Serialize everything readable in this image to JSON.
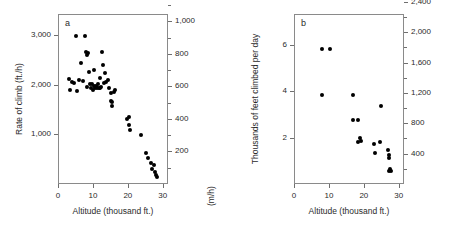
{
  "figure": {
    "panels": [
      {
        "letter": "a",
        "x_axis": {
          "title": "Altitude (thousand ft.)",
          "ticks": [
            "0",
            "10",
            "20",
            "30"
          ],
          "tick_values": [
            0,
            10,
            20,
            30
          ],
          "range": [
            0,
            31.5
          ]
        },
        "y_axis_left": {
          "title": "Rate of climb (ft./h)",
          "ticks": [
            "1,000",
            "2,000",
            "3,000"
          ],
          "tick_values": [
            1000,
            2000,
            3000
          ],
          "range": [
            0,
            3430
          ]
        },
        "y_axis_right": {
          "title": "(m/h)",
          "ticks": [
            "200",
            "400",
            "600",
            "800",
            "1,000",
            "1,200"
          ],
          "tick_values": [
            200,
            400,
            600,
            800,
            1000,
            1200
          ],
          "minor_tick_values": [
            100,
            300,
            500,
            700,
            900,
            1100
          ],
          "range": [
            0,
            1045
          ]
        }
      },
      {
        "letter": "b",
        "x_axis": {
          "title": "Altitude (thousand ft.)",
          "ticks": [
            "0",
            "10",
            "20",
            "30"
          ],
          "tick_values": [
            0,
            10,
            20,
            30
          ],
          "range": [
            0,
            31.5
          ]
        },
        "y_axis_left": {
          "title": "Thousands of feet climbed per day",
          "ticks": [
            "2",
            "4",
            "6"
          ],
          "tick_values": [
            2,
            4,
            6
          ],
          "range": [
            0,
            7.35
          ]
        },
        "y_axis_right": {
          "title": "",
          "ticks": [
            "400",
            "800",
            "1,200",
            "1,600",
            "2,000",
            "2,400"
          ],
          "tick_values": [
            400,
            800,
            1200,
            1600,
            2000,
            2400
          ],
          "minor_tick_values": [
            200,
            600,
            1000,
            1400,
            1800,
            2200
          ],
          "range": [
            0,
            2240
          ]
        }
      }
    ]
  },
  "chart_data": [
    {
      "type": "scatter",
      "panel": "a",
      "title": "",
      "xlabel": "Altitude (thousand ft.)",
      "ylabel": "Rate of climb (ft./h)",
      "ylabel_right": "(m/h)",
      "xlim": [
        0,
        31.5
      ],
      "ylim": [
        0,
        3430
      ],
      "ylim_right": [
        0,
        1045
      ],
      "grid": false,
      "legend": "none",
      "marker": "filled-circle",
      "points": [
        [
          3.2,
          2120
        ],
        [
          3.3,
          1900
        ],
        [
          4.1,
          2060
        ],
        [
          4.6,
          2030
        ],
        [
          5.2,
          2990
        ],
        [
          5.3,
          1880
        ],
        [
          6.0,
          2090
        ],
        [
          6.6,
          2450
        ],
        [
          7.2,
          2070
        ],
        [
          7.6,
          2980
        ],
        [
          8.1,
          2660
        ],
        [
          8.3,
          2600
        ],
        [
          8.4,
          1960
        ],
        [
          8.6,
          2640
        ],
        [
          8.8,
          2250
        ],
        [
          9.2,
          2020
        ],
        [
          9.5,
          1930
        ],
        [
          9.7,
          2020
        ],
        [
          10.0,
          1900
        ],
        [
          10.2,
          2310
        ],
        [
          10.4,
          1980
        ],
        [
          10.6,
          1930
        ],
        [
          10.8,
          1970
        ],
        [
          11.0,
          1960
        ],
        [
          11.2,
          1930
        ],
        [
          11.4,
          2010
        ],
        [
          11.6,
          1940
        ],
        [
          11.9,
          1930
        ],
        [
          12.0,
          2140
        ],
        [
          12.3,
          1960
        ],
        [
          12.6,
          2660
        ],
        [
          12.9,
          2400
        ],
        [
          13.1,
          2040
        ],
        [
          13.4,
          2230
        ],
        [
          13.7,
          2050
        ],
        [
          14.2,
          2100
        ],
        [
          14.6,
          1940
        ],
        [
          15.1,
          1830
        ],
        [
          15.3,
          1680
        ],
        [
          15.5,
          1660
        ],
        [
          15.6,
          1580
        ],
        [
          15.9,
          1860
        ],
        [
          16.4,
          1900
        ],
        [
          19.9,
          1320
        ],
        [
          20.2,
          1350
        ],
        [
          20.4,
          1200
        ],
        [
          20.6,
          1080
        ],
        [
          23.8,
          980
        ],
        [
          25.3,
          620
        ],
        [
          25.8,
          520
        ],
        [
          26.7,
          430
        ],
        [
          26.9,
          300
        ],
        [
          27.4,
          390
        ],
        [
          27.8,
          250
        ],
        [
          28.0,
          180
        ],
        [
          28.3,
          140
        ]
      ]
    },
    {
      "type": "scatter",
      "panel": "b",
      "title": "",
      "xlabel": "Altitude (thousand ft.)",
      "ylabel": "Thousands of feet climbed per day",
      "ylabel_right": "",
      "xlim": [
        0,
        31.5
      ],
      "ylim": [
        0,
        7.35
      ],
      "ylim_right": [
        0,
        2240
      ],
      "grid": false,
      "legend": "none",
      "marker": "filled-circle",
      "points": [
        [
          8.0,
          5.82
        ],
        [
          8.1,
          3.86
        ],
        [
          10.2,
          5.82
        ],
        [
          16.8,
          3.83
        ],
        [
          17.0,
          2.78
        ],
        [
          18.3,
          2.78
        ],
        [
          18.4,
          1.82
        ],
        [
          18.9,
          1.97
        ],
        [
          19.2,
          1.88
        ],
        [
          23.0,
          1.74
        ],
        [
          23.2,
          1.33
        ],
        [
          24.6,
          1.8
        ],
        [
          24.9,
          3.36
        ],
        [
          27.0,
          1.46
        ],
        [
          27.2,
          1.12
        ],
        [
          27.3,
          1.25
        ],
        [
          27.1,
          0.58
        ],
        [
          27.5,
          0.66
        ],
        [
          27.7,
          0.56
        ]
      ]
    }
  ]
}
